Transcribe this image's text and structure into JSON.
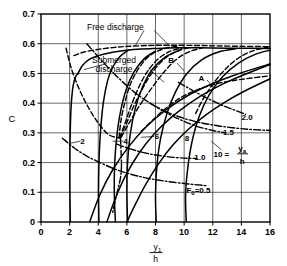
{
  "chart_data": {
    "type": "line",
    "title": "",
    "xlabel": "y1/h",
    "ylabel": "C",
    "xlim": [
      0,
      16
    ],
    "ylim": [
      0,
      0.7
    ],
    "grid": true,
    "legend_position": "inline-annotations",
    "x_ticks": [
      "0",
      "2",
      "4",
      "6",
      "8",
      "10",
      "12",
      "14",
      "16"
    ],
    "y_ticks": [
      "0",
      "0.1",
      "0.2",
      "0.3",
      "0.4",
      "0.5",
      "0.6",
      "0.7"
    ],
    "annotations": [
      {
        "text": "Free discharge",
        "x": 5.2,
        "y": 0.655
      },
      {
        "text": "Submerged",
        "x": 5.1,
        "y": 0.545
      },
      {
        "text": "discharge",
        "x": 5.1,
        "y": 0.515
      },
      {
        "text": "B",
        "x": 9.1,
        "y": 0.545
      },
      {
        "text": "A",
        "x": 11.2,
        "y": 0.485
      },
      {
        "text": "2.0",
        "x": 14.4,
        "y": 0.355
      },
      {
        "text": "1.5",
        "x": 13.1,
        "y": 0.302
      },
      {
        "text": "1.0",
        "x": 11.1,
        "y": 0.218
      },
      {
        "text": "2",
        "x": 2.9,
        "y": 0.272
      },
      {
        "text": "4",
        "x": 5.9,
        "y": 0.272
      },
      {
        "text": "6",
        "x": 8.1,
        "y": 0.288
      },
      {
        "text": "8",
        "x": 10.2,
        "y": 0.283
      },
      {
        "text": "10 =",
        "x": 12.6,
        "y": 0.228
      },
      {
        "text": "ya",
        "x": 14.05,
        "y": 0.248
      },
      {
        "text": "h",
        "x": 14.05,
        "y": 0.205
      },
      {
        "text": "F0 = 0.5",
        "x": 11.0,
        "y": 0.108
      }
    ],
    "series": [
      {
        "name": "free-discharge-solid",
        "style": "solid",
        "points": [
          [
            2.55,
            0.497
          ],
          [
            2.9,
            0.527
          ],
          [
            3.4,
            0.548
          ],
          [
            4.0,
            0.56
          ],
          [
            5.0,
            0.571
          ],
          [
            6.0,
            0.578
          ],
          [
            7.0,
            0.582
          ],
          [
            8.0,
            0.584
          ],
          [
            9.5,
            0.586
          ],
          [
            11.0,
            0.586
          ],
          [
            13.0,
            0.585
          ],
          [
            16.0,
            0.584
          ]
        ]
      },
      {
        "name": "free-discharge-dashed-upper",
        "style": "dashed",
        "points": [
          [
            2.3,
            0.56
          ],
          [
            3.0,
            0.572
          ],
          [
            4.0,
            0.581
          ],
          [
            5.0,
            0.587
          ],
          [
            6.0,
            0.591
          ],
          [
            7.5,
            0.594
          ],
          [
            9.0,
            0.595
          ],
          [
            11.0,
            0.594
          ],
          [
            13.0,
            0.592
          ],
          [
            16.0,
            0.59
          ]
        ]
      },
      {
        "name": "submerged-curve-2",
        "style": "solid",
        "points": [
          [
            2.05,
            0.0
          ],
          [
            2.02,
            0.1
          ],
          [
            2.02,
            0.22
          ],
          [
            2.05,
            0.32
          ],
          [
            2.12,
            0.4
          ],
          [
            2.25,
            0.46
          ],
          [
            2.45,
            0.492
          ],
          [
            2.62,
            0.5
          ]
        ]
      },
      {
        "name": "submerged-curve-4",
        "style": "solid",
        "points": [
          [
            4.05,
            0.0
          ],
          [
            4.02,
            0.1
          ],
          [
            4.05,
            0.2
          ],
          [
            4.15,
            0.3
          ],
          [
            4.35,
            0.4
          ],
          [
            4.65,
            0.475
          ],
          [
            5.0,
            0.52
          ],
          [
            5.5,
            0.556
          ],
          [
            6.1,
            0.578
          ]
        ]
      },
      {
        "name": "submerged-curve-5",
        "style": "solid",
        "points": [
          [
            5.2,
            0.0
          ],
          [
            5.12,
            0.1
          ],
          [
            5.15,
            0.2
          ],
          [
            5.3,
            0.29
          ],
          [
            5.55,
            0.37
          ],
          [
            5.95,
            0.445
          ],
          [
            6.5,
            0.505
          ],
          [
            7.2,
            0.549
          ],
          [
            8.0,
            0.575
          ]
        ]
      },
      {
        "name": "submerged-curve-6",
        "style": "solid",
        "points": [
          [
            6.05,
            0.0
          ],
          [
            6.0,
            0.1
          ],
          [
            6.05,
            0.2
          ],
          [
            6.25,
            0.3
          ],
          [
            6.6,
            0.385
          ],
          [
            7.1,
            0.455
          ],
          [
            7.8,
            0.515
          ],
          [
            8.7,
            0.556
          ],
          [
            9.7,
            0.578
          ]
        ]
      },
      {
        "name": "submerged-curve-8",
        "style": "solid",
        "points": [
          [
            8.05,
            0.0
          ],
          [
            8.0,
            0.09
          ],
          [
            8.1,
            0.19
          ],
          [
            8.35,
            0.28
          ],
          [
            8.8,
            0.365
          ],
          [
            9.4,
            0.438
          ],
          [
            10.2,
            0.5
          ],
          [
            11.2,
            0.545
          ],
          [
            12.4,
            0.572
          ],
          [
            13.6,
            0.583
          ]
        ]
      },
      {
        "name": "submerged-curve-10",
        "style": "solid",
        "points": [
          [
            10.15,
            0.0
          ],
          [
            10.1,
            0.09
          ],
          [
            10.25,
            0.18
          ],
          [
            10.55,
            0.27
          ],
          [
            11.05,
            0.355
          ],
          [
            11.75,
            0.428
          ],
          [
            12.7,
            0.49
          ],
          [
            13.8,
            0.535
          ],
          [
            15.0,
            0.565
          ],
          [
            16.0,
            0.578
          ]
        ]
      },
      {
        "name": "ya-h-curve-1.0",
        "style": "solid",
        "points": [
          [
            6.0,
            0.0
          ],
          [
            6.6,
            0.06
          ],
          [
            7.3,
            0.125
          ],
          [
            8.2,
            0.195
          ],
          [
            9.2,
            0.258
          ],
          [
            10.3,
            0.312
          ],
          [
            11.5,
            0.36
          ],
          [
            12.8,
            0.402
          ],
          [
            14.2,
            0.44
          ],
          [
            16.0,
            0.482
          ]
        ]
      },
      {
        "name": "ya-h-curve-1.5",
        "style": "solid",
        "points": [
          [
            4.6,
            0.0
          ],
          [
            5.2,
            0.08
          ],
          [
            5.9,
            0.155
          ],
          [
            6.8,
            0.228
          ],
          [
            7.9,
            0.296
          ],
          [
            9.1,
            0.352
          ],
          [
            10.4,
            0.4
          ],
          [
            11.8,
            0.442
          ],
          [
            13.4,
            0.48
          ],
          [
            16.0,
            0.53
          ]
        ]
      },
      {
        "name": "ya-h-curve-2.0",
        "style": "solid",
        "points": [
          [
            3.4,
            0.0
          ],
          [
            4.1,
            0.09
          ],
          [
            5.0,
            0.175
          ],
          [
            6.1,
            0.252
          ],
          [
            7.3,
            0.318
          ],
          [
            8.7,
            0.376
          ],
          [
            10.2,
            0.424
          ],
          [
            11.8,
            0.462
          ],
          [
            13.5,
            0.494
          ],
          [
            16.0,
            0.532
          ]
        ]
      },
      {
        "name": "branch-A-dashed",
        "style": "dashed",
        "points": [
          [
            7.0,
            0.305
          ],
          [
            8.0,
            0.352
          ],
          [
            9.0,
            0.393
          ],
          [
            10.0,
            0.425
          ],
          [
            11.2,
            0.45
          ],
          [
            12.5,
            0.468
          ],
          [
            14.0,
            0.48
          ],
          [
            16.0,
            0.492
          ]
        ]
      },
      {
        "name": "branch-B-dashed",
        "style": "dashed",
        "points": [
          [
            5.6,
            0.285
          ],
          [
            6.3,
            0.345
          ],
          [
            7.0,
            0.4
          ],
          [
            7.8,
            0.455
          ],
          [
            8.6,
            0.505
          ],
          [
            9.4,
            0.545
          ],
          [
            10.3,
            0.572
          ],
          [
            11.3,
            0.586
          ]
        ]
      },
      {
        "name": "branch-dashed-mid1",
        "style": "dashed",
        "points": [
          [
            5.5,
            0.283
          ],
          [
            6.0,
            0.335
          ],
          [
            6.5,
            0.392
          ],
          [
            7.1,
            0.45
          ],
          [
            7.8,
            0.505
          ],
          [
            8.6,
            0.548
          ],
          [
            9.5,
            0.575
          ],
          [
            10.5,
            0.588
          ]
        ]
      },
      {
        "name": "branch-dashed-mid2",
        "style": "dashed",
        "points": [
          [
            5.5,
            0.283
          ],
          [
            5.85,
            0.33
          ],
          [
            6.25,
            0.385
          ],
          [
            6.75,
            0.445
          ],
          [
            7.35,
            0.5
          ],
          [
            8.1,
            0.545
          ],
          [
            9.0,
            0.574
          ],
          [
            10.0,
            0.588
          ]
        ]
      },
      {
        "name": "branch-dashed-left",
        "style": "dashed",
        "points": [
          [
            5.45,
            0.283
          ],
          [
            5.6,
            0.345
          ],
          [
            5.9,
            0.41
          ],
          [
            6.3,
            0.47
          ],
          [
            6.9,
            0.522
          ],
          [
            7.6,
            0.56
          ],
          [
            8.5,
            0.582
          ],
          [
            9.5,
            0.592
          ]
        ]
      },
      {
        "name": "branch-dashed-far-right",
        "style": "dashed",
        "points": [
          [
            10.8,
            0.365
          ],
          [
            11.4,
            0.42
          ],
          [
            12.1,
            0.47
          ],
          [
            12.9,
            0.515
          ],
          [
            13.8,
            0.552
          ],
          [
            14.8,
            0.576
          ],
          [
            16.0,
            0.59
          ]
        ]
      },
      {
        "name": "upper-left-dashed",
        "style": "dashed",
        "points": [
          [
            1.75,
            0.585
          ],
          [
            2.1,
            0.52
          ],
          [
            2.6,
            0.455
          ],
          [
            3.2,
            0.395
          ],
          [
            3.9,
            0.34
          ],
          [
            4.7,
            0.295
          ],
          [
            5.45,
            0.283
          ]
        ]
      },
      {
        "name": "diagonal-dashdot-upper",
        "style": "dashdot",
        "points": [
          [
            3.2,
            0.6
          ],
          [
            4.2,
            0.545
          ],
          [
            5.3,
            0.49
          ],
          [
            6.5,
            0.438
          ],
          [
            7.8,
            0.395
          ],
          [
            9.2,
            0.362
          ],
          [
            10.8,
            0.338
          ],
          [
            12.6,
            0.322
          ],
          [
            14.5,
            0.312
          ],
          [
            16.0,
            0.308
          ]
        ]
      },
      {
        "name": "dashdot-F0-0.5",
        "style": "dashdot",
        "points": [
          [
            1.5,
            0.282
          ],
          [
            2.3,
            0.25
          ],
          [
            3.2,
            0.222
          ],
          [
            4.3,
            0.196
          ],
          [
            5.5,
            0.172
          ],
          [
            7.0,
            0.152
          ],
          [
            8.6,
            0.138
          ],
          [
            10.3,
            0.128
          ],
          [
            11.6,
            0.122
          ]
        ]
      },
      {
        "name": "dashdot-1.0-label-line",
        "style": "dashdot",
        "points": [
          [
            5.3,
            0.262
          ],
          [
            6.3,
            0.245
          ],
          [
            7.5,
            0.23
          ],
          [
            8.8,
            0.22
          ],
          [
            10.0,
            0.215
          ],
          [
            10.9,
            0.214
          ]
        ]
      },
      {
        "name": "dashdot-1.5-label-line",
        "style": "dashdot",
        "points": [
          [
            7.6,
            0.4
          ],
          [
            8.6,
            0.372
          ],
          [
            9.7,
            0.345
          ],
          [
            10.9,
            0.322
          ],
          [
            12.1,
            0.307
          ],
          [
            12.9,
            0.3
          ]
        ]
      },
      {
        "name": "dashdot-2.0-label-line",
        "style": "dashdot",
        "points": [
          [
            9.6,
            0.47
          ],
          [
            10.7,
            0.44
          ],
          [
            11.8,
            0.412
          ],
          [
            12.9,
            0.388
          ],
          [
            13.9,
            0.37
          ],
          [
            14.3,
            0.362
          ]
        ]
      },
      {
        "name": "dashdot-crossing-left",
        "style": "dashdot",
        "points": [
          [
            5.55,
            0.285
          ],
          [
            5.6,
            0.23
          ],
          [
            5.62,
            0.185
          ],
          [
            5.55,
            0.148
          ],
          [
            5.4,
            0.115
          ],
          [
            5.2,
            0.075
          ],
          [
            5.0,
            0.03
          ]
        ]
      }
    ],
    "leader_lines": [
      {
        "name": "free-discharge-leader",
        "from": [
          7.9,
          0.645
        ],
        "to": [
          9.0,
          0.592
        ]
      },
      {
        "name": "free-discharge-leader2",
        "from": [
          7.2,
          0.645
        ],
        "to": [
          6.6,
          0.594
        ]
      },
      {
        "name": "submerged-leader",
        "from": [
          4.6,
          0.533
        ],
        "to": [
          3.0,
          0.513
        ]
      },
      {
        "name": "submerged-leader2",
        "from": [
          7.5,
          0.518
        ],
        "to": [
          8.6,
          0.47
        ]
      },
      {
        "name": "B-leader",
        "from": [
          9.5,
          0.535
        ],
        "to": [
          10.0,
          0.508
        ]
      },
      {
        "name": "A-leader",
        "from": [
          11.6,
          0.478
        ],
        "to": [
          12.0,
          0.455
        ]
      },
      {
        "name": "label-2-leader",
        "from": [
          2.75,
          0.272
        ],
        "to": [
          2.05,
          0.265
        ]
      },
      {
        "name": "label-4-leader",
        "from": [
          5.75,
          0.272
        ],
        "to": [
          5.0,
          0.272
        ]
      },
      {
        "name": "label-6-leader",
        "from": [
          7.9,
          0.288
        ],
        "to": [
          7.0,
          0.285
        ]
      },
      {
        "name": "ya-h-leader",
        "from": [
          12.6,
          0.243
        ],
        "to": [
          11.9,
          0.272
        ]
      }
    ]
  }
}
